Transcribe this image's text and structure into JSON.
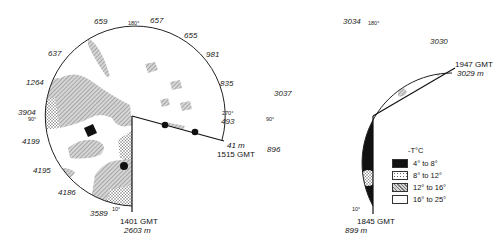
{
  "dials": [
    {
      "id": "left",
      "start": {
        "time": "1401 GMT",
        "depth": "2603 m"
      },
      "end": {
        "time": "1515 GMT",
        "depth": "41 m"
      },
      "degree_marks": {
        "d10": "10°",
        "d90": "90°",
        "d180": "180°",
        "d270": "270°"
      },
      "depth_labels": [
        "3589",
        "4186",
        "4195",
        "4199",
        "3904",
        "1264",
        "637",
        "659",
        "657",
        "655",
        "981",
        "835",
        "493"
      ]
    },
    {
      "id": "right",
      "start": {
        "time": "1845 GMT",
        "depth": "899 m"
      },
      "end": {
        "time": "1947 GMT",
        "depth": "3029 m"
      },
      "degree_marks": {
        "d10": "10°",
        "d90": "90°",
        "d180": "180°"
      },
      "depth_labels": [
        "896",
        "3037",
        "3034",
        "3030"
      ]
    }
  ],
  "legend": {
    "title": "-T°C",
    "items": [
      {
        "label": "4° to 8°",
        "pattern": "solid-black",
        "color": "#111111"
      },
      {
        "label": "8° to 12°",
        "pattern": "stipple",
        "color": "#cfcfcf"
      },
      {
        "label": "12° to 16°",
        "pattern": "hatch",
        "color": "#9a9a9a"
      },
      {
        "label": "16° to 25°",
        "pattern": "blank",
        "color": "#ffffff"
      }
    ]
  }
}
